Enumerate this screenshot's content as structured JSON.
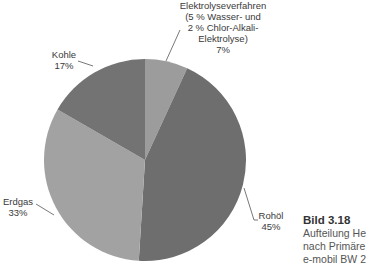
{
  "chart_data": {
    "type": "pie",
    "title": "",
    "slices": [
      {
        "label": "Elektrolyseverfahren (5 % Wasser- und 2 % Chlor-Alkali-Elektrolyse)",
        "value": 7,
        "color": "#9c9c9c"
      },
      {
        "label": "Rohöl",
        "value": 45,
        "color": "#6e6e6e"
      },
      {
        "label": "Erdgas",
        "value": 33,
        "color": "#a2a2a2"
      },
      {
        "label": "Kohle",
        "value": 17,
        "color": "#737373"
      }
    ],
    "start_angle_deg": 0,
    "direction": "clockwise",
    "legend": "none"
  },
  "labels": {
    "elektrolyse": {
      "line1": "Elektrolyseverfahren",
      "line2": "(5 % Wasser- und",
      "line3": "2 % Chlor-Alkali-",
      "line4": "Elektrolyse)",
      "pct": "7%"
    },
    "kohle": {
      "name": "Kohle",
      "pct": "17%"
    },
    "erdgas": {
      "name": "Erdgas",
      "pct": "33%"
    },
    "rohoel": {
      "name": "Rohöl",
      "pct": "45%"
    }
  },
  "caption": {
    "title": "Bild 3.18",
    "line1": "Aufteilung He",
    "line2": "nach Primäre",
    "line3": "e-mobil BW 2"
  }
}
